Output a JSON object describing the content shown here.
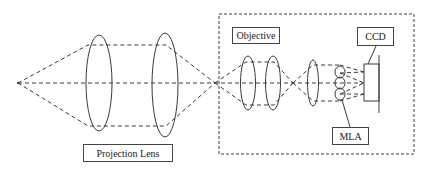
{
  "diagram": {
    "title": "",
    "labels": {
      "projection_lens": "Projection Lens",
      "objective": "Objective",
      "ccd": "CCD",
      "mla": "MLA"
    },
    "colors": {
      "line": "#3a3a3a",
      "background": "#ffffff"
    },
    "components": [
      {
        "id": "source-point",
        "type": "point"
      },
      {
        "id": "projection-lens-1",
        "type": "lens",
        "group": "Projection Lens"
      },
      {
        "id": "projection-lens-2",
        "type": "lens",
        "group": "Projection Lens"
      },
      {
        "id": "objective-lens-1",
        "type": "lens",
        "group": "Objective"
      },
      {
        "id": "objective-lens-2",
        "type": "lens",
        "group": "Objective"
      },
      {
        "id": "relay-lens",
        "type": "lens"
      },
      {
        "id": "microlens-array",
        "type": "lens-array",
        "label": "MLA",
        "count": 3
      },
      {
        "id": "ccd-sensor",
        "type": "detector",
        "label": "CCD"
      },
      {
        "id": "camera-enclosure",
        "type": "dashed-box"
      }
    ]
  }
}
